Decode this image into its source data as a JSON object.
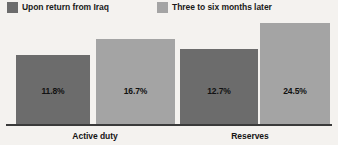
{
  "chart_data": {
    "type": "bar",
    "title": "",
    "subtitle": "",
    "xlabel": "",
    "ylabel": "",
    "grid": false,
    "legend_position": "top",
    "categories": [
      "Active duty",
      "Reserves"
    ],
    "ylim": [
      0,
      30
    ],
    "value_suffix": "%",
    "series": [
      {
        "name": "Upon return from Iraq",
        "color": "#6c6c6c",
        "values": [
          11.8,
          16.7
        ],
        "labels": [
          "11.8%",
          "12.7%"
        ]
      },
      {
        "name": "Three to six months later",
        "color": "#a4a4a4",
        "values": [
          16.7,
          24.5
        ],
        "labels": [
          "16.7%",
          "24.5%"
        ]
      }
    ],
    "bars": [
      {
        "group": "Active duty",
        "series": "Upon return from Iraq",
        "value": 11.8,
        "label": "11.8%",
        "color": "#6c6c6c"
      },
      {
        "group": "Active duty",
        "series": "Three to six months later",
        "value": 16.7,
        "label": "16.7%",
        "color": "#a4a4a4"
      },
      {
        "group": "Reserves",
        "series": "Upon return from Iraq",
        "value": 12.7,
        "label": "12.7%",
        "color": "#6c6c6c"
      },
      {
        "group": "Reserves",
        "series": "Three to six months later",
        "value": 24.5,
        "label": "24.5%",
        "color": "#a4a4a4"
      }
    ]
  },
  "legend": {
    "items": [
      {
        "label": "Upon return from Iraq",
        "color": "#6c6c6c"
      },
      {
        "label": "Three to six months later",
        "color": "#a4a4a4"
      }
    ]
  },
  "axis": {
    "categories": [
      {
        "label": "Active duty"
      },
      {
        "label": "Reserves"
      }
    ]
  },
  "colors": {
    "background": "#f4f2ef",
    "series_dark": "#6c6c6c",
    "series_light": "#a4a4a4",
    "axis_line": "#3a3a3a",
    "text": "#141414"
  },
  "geometry": {
    "baseline_y": 124,
    "bars": [
      {
        "x": 16,
        "width": 74,
        "top": 55
      },
      {
        "x": 96,
        "width": 79,
        "top": 39
      },
      {
        "x": 180,
        "width": 78,
        "top": 49
      },
      {
        "x": 260,
        "width": 70,
        "top": 23
      }
    ],
    "value_label_y": 86
  }
}
